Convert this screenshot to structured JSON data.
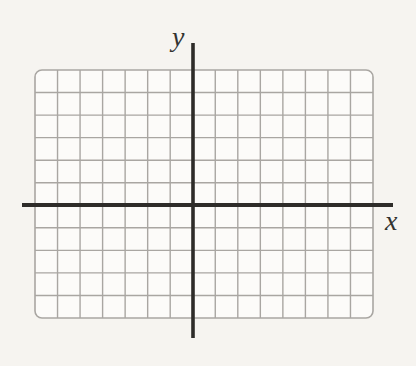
{
  "figure": {
    "type": "blank-coordinate-plane",
    "labels": {
      "x_axis": "x",
      "y_axis": "y"
    },
    "grid": {
      "columns": 15,
      "rows": 11,
      "origin_column_from_left": 7,
      "origin_row_from_top": 6,
      "tick_labels": "none",
      "data_points": "none"
    },
    "layout": {
      "grid_left": 35,
      "grid_top": 70,
      "grid_width": 338,
      "grid_height": 248,
      "corner_radius": 7,
      "y_axis_x": 193,
      "y_axis_top": 43,
      "y_axis_bottom": 338,
      "x_axis_y": 205,
      "x_axis_left": 22,
      "x_axis_right": 393,
      "axis_thickness": 4,
      "grid_line_thickness": 1.4
    },
    "colors": {
      "page_background": "#f6f4f0",
      "grid_fill": "#fcfbf9",
      "grid_line": "#a9a6a2",
      "axis": "#2e2c29",
      "label": "#333330"
    }
  }
}
